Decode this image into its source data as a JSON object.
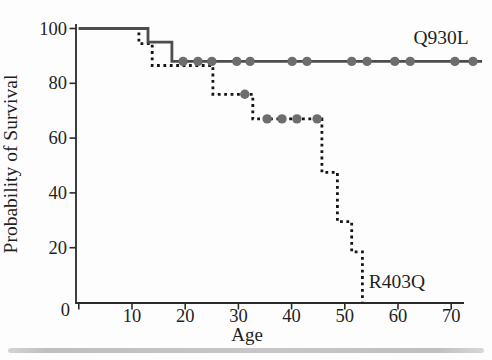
{
  "figure": {
    "background_color": "#fdfdfd",
    "bottom_bar_color": "#c6c6c6"
  },
  "chart_data": {
    "type": "line",
    "subtype": "kaplan-meier-step",
    "title": "",
    "xlabel": "Age",
    "ylabel": "Probability of Survival",
    "xlim": [
      0,
      77
    ],
    "ylim": [
      0,
      100
    ],
    "x_ticks": [
      10,
      20,
      30,
      40,
      50,
      60,
      70
    ],
    "y_ticks": [
      20,
      40,
      60,
      80,
      100
    ],
    "origin_label": "0",
    "grid": false,
    "legend_position": "inline-labels",
    "axis_color": "#2a2a2a",
    "text_color": "#1f1f1f",
    "series": [
      {
        "name": "R403Q",
        "label": "R403Q",
        "line_style": "dotted",
        "color": "#151515",
        "marker_color": "#6d6d6d",
        "steps": [
          [
            0,
            100
          ],
          [
            11.3,
            100
          ],
          [
            11.3,
            94.5
          ],
          [
            13.8,
            94.5
          ],
          [
            13.8,
            86.5
          ],
          [
            25.2,
            86.5
          ],
          [
            25.2,
            76
          ],
          [
            32.7,
            76
          ],
          [
            32.7,
            67
          ],
          [
            45.7,
            67
          ],
          [
            45.7,
            47.5
          ],
          [
            48.6,
            47.5
          ],
          [
            48.6,
            29.5
          ],
          [
            51.3,
            29.5
          ],
          [
            51.3,
            18.5
          ],
          [
            53.3,
            18.5
          ],
          [
            53.3,
            0
          ]
        ],
        "censor_marks": [
          [
            31.2,
            76
          ],
          [
            35.4,
            67
          ],
          [
            38.2,
            67
          ],
          [
            41.0,
            67
          ],
          [
            44.8,
            67
          ]
        ],
        "label_px": {
          "x": 397,
          "y": 288
        }
      },
      {
        "name": "Q930L",
        "label": "Q930L",
        "line_style": "solid",
        "color": "#4d4d4d",
        "marker_color": "#6d6d6d",
        "steps": [
          [
            0,
            100
          ],
          [
            13,
            100
          ],
          [
            13,
            95
          ],
          [
            17.5,
            95
          ],
          [
            17.5,
            88
          ],
          [
            75.8,
            88
          ]
        ],
        "censor_marks": [
          [
            19.6,
            88
          ],
          [
            22.4,
            88
          ],
          [
            25.0,
            88
          ],
          [
            29.7,
            88
          ],
          [
            32.2,
            88
          ],
          [
            40.1,
            88
          ],
          [
            42.9,
            88
          ],
          [
            51.3,
            88
          ],
          [
            54.2,
            88
          ],
          [
            59.4,
            88
          ],
          [
            62.3,
            88
          ],
          [
            70.7,
            88
          ],
          [
            74.1,
            88
          ]
        ],
        "label_px": {
          "x": 441,
          "y": 44
        }
      }
    ]
  }
}
